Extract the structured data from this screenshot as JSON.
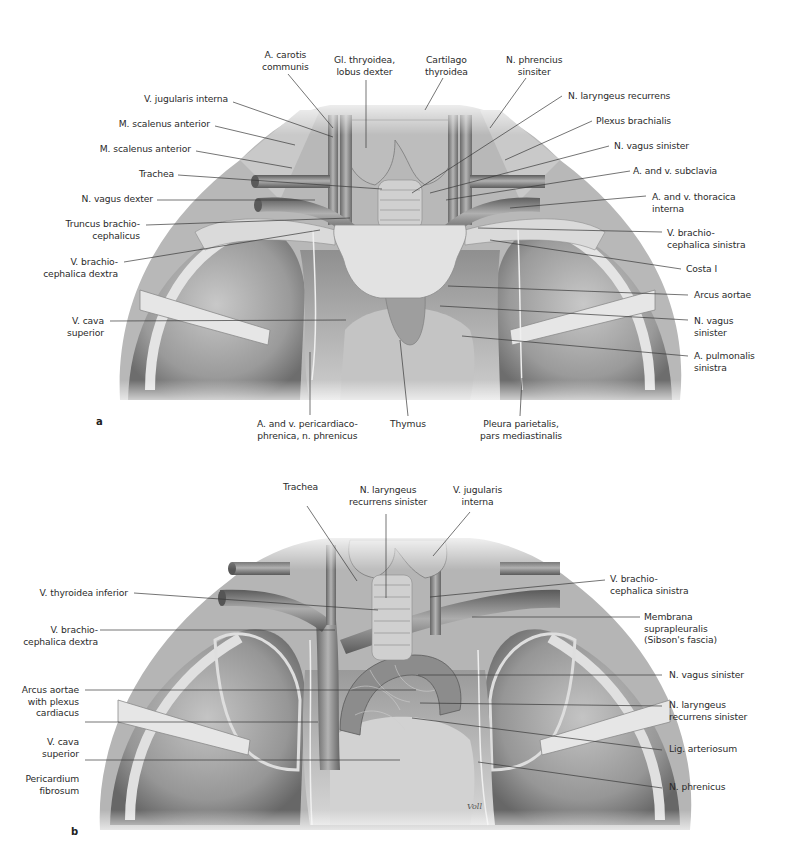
{
  "figure_a": {
    "panel_letter": "a",
    "labels": {
      "a_carotis": "A. carotis\ncommunis",
      "gl_thyroidea": "Gl. thryoidea,\nlobus dexter",
      "cartilago": "Cartilago\nthyroidea",
      "n_phrenicus_sin": "N. phrencius\nsinsiter",
      "v_jugularis": "V. jugularis interna",
      "m_scalenus_1": "M. scalenus anterior",
      "m_scalenus_2": "M. scalenus anterior",
      "trachea": "Trachea",
      "n_vagus_dexter": "N. vagus dexter",
      "truncus": "Truncus brachio-\ncephalicus",
      "v_brachio_dextra": "V. brachio-\ncephalica dextra",
      "v_cava": "V. cava\nsuperior",
      "n_laryngeus": "N. laryngeus recurrens",
      "plexus": "Plexus brachialis",
      "n_vagus_sinister": "N. vagus sinister",
      "a_subclavia": "A. and v. subclavia",
      "a_thoracica": "A. and v. thoracica\ninterna",
      "v_brachio_sinistra": "V. brachio-\ncephalica sinistra",
      "costa": "Costa I",
      "arcus": "Arcus aortae",
      "n_vagus_sin2": "N. vagus\nsinister",
      "a_pulmonalis": "A. pulmonalis\nsinistra",
      "pericardiaco": "A. and v. pericardiaco-\nphrenica, n. phrenicus",
      "thymus": "Thymus",
      "pleura": "Pleura parietalis,\npars mediastinalis"
    }
  },
  "figure_b": {
    "panel_letter": "b",
    "signature": "Voll",
    "labels": {
      "trachea": "Trachea",
      "n_laryngeus": "N. laryngeus\nrecurrens sinister",
      "v_jugularis": "V. jugularis\ninterna",
      "v_thyroidea": "V. thyroidea inferior",
      "v_brachio_dextra": "V. brachio-\ncephalica dextra",
      "arcus": "Arcus aortae\nwith plexus\ncardiacus",
      "v_cava": "V. cava\nsuperior",
      "pericardium": "Pericardium\nfibrosum",
      "v_brachio_sinistra": "V. brachio-\ncephalica sinistra",
      "membrana": "Membrana\nsuprapleuralis\n(Sibson's fascia)",
      "n_vagus_sinister": "N. vagus sinister",
      "n_laryngeus_sin": "N. laryngeus\nrecurrens sinister",
      "lig_arteriosum": "Lig. arteriosum",
      "n_phrenicus": "N. phrenicus"
    }
  },
  "colors": {
    "background": "#ffffff",
    "label_text": "#2b2b2b",
    "leader_line": "#3a3a3a",
    "tissue_light": "#d9d9d9",
    "tissue_mid": "#a8a8a8",
    "tissue_dark": "#5e5e5e"
  }
}
